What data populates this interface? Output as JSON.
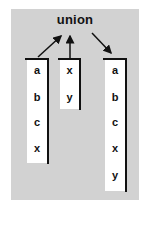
{
  "diagram": {
    "title": "union",
    "inputs": [
      {
        "name": "list-1",
        "items": [
          "a",
          "b",
          "c",
          "x"
        ]
      },
      {
        "name": "list-2",
        "items": [
          "x",
          "y"
        ]
      }
    ],
    "output": {
      "name": "result",
      "items": [
        "a",
        "b",
        "c",
        "x",
        "y"
      ]
    },
    "colors": {
      "background": "#d2d2d2",
      "box": "#ffffff",
      "ink": "#111111"
    }
  }
}
